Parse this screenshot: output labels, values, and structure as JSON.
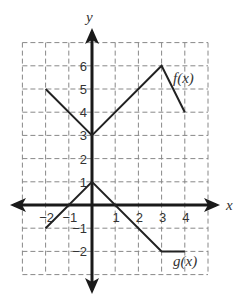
{
  "chart_data": {
    "type": "line",
    "title": "",
    "xlabel": "x",
    "ylabel": "y",
    "xlim": [
      -3,
      5
    ],
    "ylim": [
      -3,
      7
    ],
    "grid": true,
    "grid_style": "dashed",
    "x_ticks": [
      "-2",
      "-1",
      "1",
      "2",
      "3",
      "4"
    ],
    "y_ticks": [
      "6",
      "5",
      "4",
      "3",
      "2",
      "1",
      "-1",
      "-2"
    ],
    "series": [
      {
        "name": "f(x)",
        "label": "f(x)",
        "points": [
          [
            -2,
            5
          ],
          [
            0,
            3
          ],
          [
            3,
            6
          ],
          [
            4,
            4
          ]
        ]
      },
      {
        "name": "g(x)",
        "label": "g(x)",
        "points": [
          [
            -2,
            -1
          ],
          [
            0,
            1
          ],
          [
            3,
            -2
          ],
          [
            4,
            -2
          ]
        ]
      }
    ]
  },
  "labels": {
    "x_axis": "x",
    "y_axis": "y",
    "f": "f(x)",
    "g": "g(x)"
  }
}
